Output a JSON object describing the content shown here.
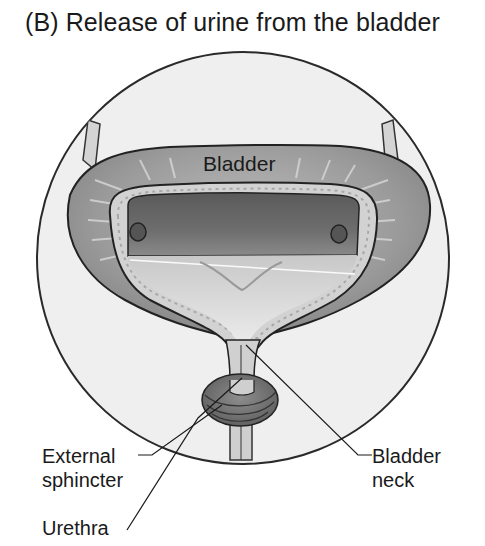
{
  "figure": {
    "title": "(B) Release of urine from the bladder",
    "labels": {
      "bladder": "Bladder",
      "external_sphincter_line1": "External",
      "external_sphincter_line2": "sphincter",
      "urethra": "Urethra",
      "bladder_neck_line1": "Bladder",
      "bladder_neck_line2": "neck"
    }
  }
}
